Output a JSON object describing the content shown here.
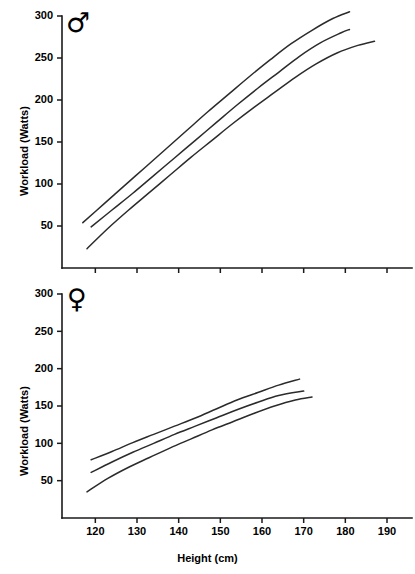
{
  "figure": {
    "background": "#ffffff",
    "line_color": "#2b2b2b",
    "axis_color": "#1a1a1a"
  },
  "panels": [
    {
      "id": "male",
      "symbol": "♂",
      "symbol_name": "male-sex-symbol",
      "ylabel": "Workload (Watts)",
      "xlabel": "",
      "y_ticks": [
        "300",
        "250",
        "200",
        "150",
        "100",
        "50"
      ],
      "x_ticks": [
        "",
        "",
        "",
        "",
        "",
        "",
        "",
        ""
      ]
    },
    {
      "id": "female",
      "symbol": "♀",
      "symbol_name": "female-sex-symbol",
      "ylabel": "Workload (Watts)",
      "xlabel": "Height (cm)",
      "y_ticks": [
        "300",
        "250",
        "200",
        "150",
        "100",
        "50"
      ],
      "x_ticks": [
        "120",
        "130",
        "140",
        "150",
        "160",
        "170",
        "180",
        "190"
      ]
    }
  ],
  "chart_data": [
    {
      "type": "line",
      "title": "",
      "panel": "male",
      "legend_symbol": "♂",
      "xlabel": "Height (cm)",
      "ylabel": "Workload (Watts)",
      "xlim": [
        112,
        196
      ],
      "ylim": [
        0,
        300
      ],
      "xticks": [
        120,
        130,
        140,
        150,
        160,
        170,
        180,
        190
      ],
      "xticklabels": [
        "",
        "",
        "",
        "",
        "",
        "",
        "",
        ""
      ],
      "yticks": [
        50,
        100,
        150,
        200,
        250,
        300
      ],
      "yticklabels": [
        "50",
        "100",
        "150",
        "200",
        "250",
        "300"
      ],
      "grid": false,
      "legend": "none",
      "series": [
        {
          "name": "upper confidence limit",
          "x": [
            117,
            122,
            127,
            132,
            137,
            142,
            147,
            152,
            157,
            162,
            167,
            172,
            177,
            181
          ],
          "y": [
            54,
            76,
            98,
            120,
            142,
            164,
            186,
            207,
            228,
            248,
            267,
            283,
            297,
            305
          ]
        },
        {
          "name": "mean / predicted workload",
          "x": [
            119,
            124,
            129,
            134,
            139,
            144,
            149,
            154,
            159,
            164,
            169,
            174,
            179,
            181
          ],
          "y": [
            49,
            69,
            89,
            110,
            131,
            152,
            173,
            194,
            214,
            233,
            252,
            268,
            280,
            284
          ]
        },
        {
          "name": "lower confidence limit",
          "x": [
            118,
            123,
            128,
            133,
            138,
            143,
            148,
            153,
            158,
            163,
            168,
            173,
            178,
            183,
            187
          ],
          "y": [
            23,
            47,
            69,
            90,
            111,
            132,
            152,
            172,
            191,
            209,
            227,
            243,
            256,
            265,
            270
          ]
        }
      ]
    },
    {
      "type": "line",
      "title": "",
      "panel": "female",
      "legend_symbol": "♀",
      "xlabel": "Height (cm)",
      "ylabel": "Workload (Watts)",
      "xlim": [
        112,
        196
      ],
      "ylim": [
        0,
        300
      ],
      "xticks": [
        120,
        130,
        140,
        150,
        160,
        170,
        180,
        190
      ],
      "xticklabels": [
        "120",
        "130",
        "140",
        "150",
        "160",
        "170",
        "180",
        "190"
      ],
      "yticks": [
        50,
        100,
        150,
        200,
        250,
        300
      ],
      "yticklabels": [
        "50",
        "100",
        "150",
        "200",
        "250",
        "300"
      ],
      "grid": false,
      "legend": "none",
      "series": [
        {
          "name": "upper confidence limit",
          "x": [
            119,
            124,
            129,
            134,
            139,
            144,
            149,
            154,
            159,
            164,
            169
          ],
          "y": [
            78,
            89,
            101,
            112,
            123,
            134,
            146,
            158,
            168,
            178,
            186
          ]
        },
        {
          "name": "mean / predicted workload",
          "x": [
            119,
            124,
            129,
            134,
            139,
            144,
            149,
            154,
            159,
            164,
            170
          ],
          "y": [
            61,
            75,
            88,
            100,
            112,
            123,
            134,
            145,
            155,
            164,
            170
          ]
        },
        {
          "name": "lower confidence limit",
          "x": [
            118,
            123,
            128,
            133,
            138,
            143,
            148,
            153,
            158,
            163,
            168,
            172
          ],
          "y": [
            35,
            53,
            68,
            81,
            94,
            106,
            118,
            129,
            140,
            150,
            158,
            162
          ]
        }
      ]
    }
  ]
}
